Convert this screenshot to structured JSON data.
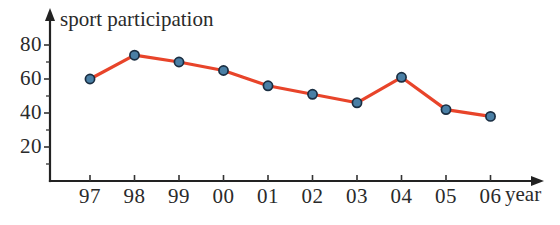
{
  "chart_data": {
    "type": "line",
    "title": "sport participation",
    "xlabel": "year",
    "ylabel": "",
    "categories": [
      "97",
      "98",
      "99",
      "00",
      "01",
      "02",
      "03",
      "04",
      "05",
      "06"
    ],
    "values": [
      60,
      74,
      70,
      65,
      56,
      51,
      46,
      61,
      42,
      38
    ],
    "series": [
      {
        "name": "sport participation",
        "values": [
          60,
          74,
          70,
          65,
          56,
          51,
          46,
          61,
          42,
          38
        ]
      }
    ],
    "ylim": [
      0,
      90
    ],
    "xlim": [
      0,
      11
    ],
    "y_ticks": [
      "20",
      "40",
      "60",
      "80"
    ],
    "y_tick_values": [
      20,
      40,
      60,
      80
    ],
    "y_minor_tick_values": [
      10,
      30,
      50,
      70
    ],
    "grid": false,
    "legend": false,
    "legend_position": "none",
    "axis_arrows": true,
    "line_color": "#E8442A",
    "marker_fill_color": "#4A7FA5",
    "marker_edge_color": "#1A2E42",
    "axis_color": "#222222",
    "text_color": "#2A2A2A",
    "background_color": "#FFFFFF"
  }
}
